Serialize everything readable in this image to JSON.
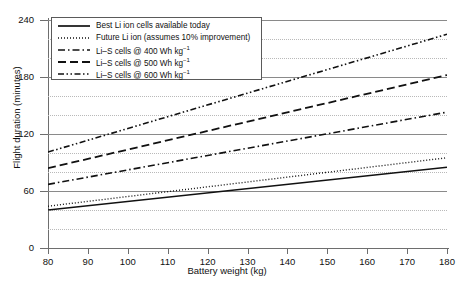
{
  "chart_data": {
    "type": "line",
    "title_line1": "",
    "title_line2": "using Li ion and Li–S batteries",
    "xlabel": "Battery weight (kg)",
    "ylabel": "Flight duration (minutes)",
    "xlim": [
      80,
      180
    ],
    "ylim": [
      0,
      240
    ],
    "xticks": [
      80,
      90,
      100,
      110,
      120,
      130,
      140,
      150,
      160,
      170,
      180
    ],
    "yticks": [
      0,
      60,
      120,
      180,
      240
    ],
    "y_minor_gridlines": [
      20,
      40,
      80,
      100,
      140,
      160,
      200,
      220
    ],
    "grid": "major solid gray, minor dotted light gray",
    "legend_position": "upper left inside axes",
    "x": [
      80,
      180
    ],
    "series": [
      {
        "name": "Best Li ion cells available today",
        "style": "solid",
        "values": [
          40,
          85
        ]
      },
      {
        "name": "Future Li ion (assumes 10% improvement)",
        "style": "dotted",
        "values": [
          44,
          95
        ]
      },
      {
        "name": "Li–S cells @ 400 Wh kg⁻¹",
        "style": "dash-dot",
        "values": [
          67,
          143
        ]
      },
      {
        "name": "Li–S cells @ 500 Wh kg⁻¹",
        "style": "dashed",
        "values": [
          84,
          182
        ]
      },
      {
        "name": "Li–S cells @ 600 Wh kg⁻¹",
        "style": "dash-dot-dot",
        "values": [
          101,
          225
        ]
      }
    ]
  },
  "legend": {
    "items": [
      {
        "label": "Best Li ion cells available today",
        "label_main": "Best Li ion cells available today",
        "sup": ""
      },
      {
        "label": "Future Li ion (assumes 10% improvement)",
        "label_main": "Future Li ion (assumes 10% improvement)",
        "sup": ""
      },
      {
        "label": "Li–S cells @ 400 Wh kg⁻¹",
        "label_main": "Li–S cells @ 400 Wh kg",
        "sup": "−1"
      },
      {
        "label": "Li–S cells @ 500 Wh kg⁻¹",
        "label_main": "Li–S cells @ 500 Wh kg",
        "sup": "−1"
      },
      {
        "label": "Li–S cells @ 600 Wh kg⁻¹",
        "label_main": "Li–S cells @ 600 Wh kg",
        "sup": "−1"
      }
    ]
  },
  "colors": {
    "line": "#111111",
    "grid_major": "#8a8a8a",
    "grid_minor": "#b9b9b9",
    "axis": "#6e6e6e",
    "background": "#ffffff"
  }
}
